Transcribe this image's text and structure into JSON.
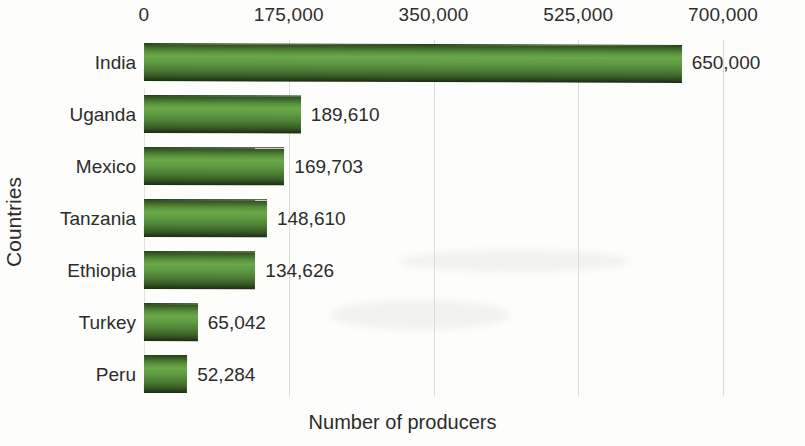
{
  "chart_data": {
    "type": "bar",
    "orientation": "horizontal",
    "title": "",
    "xlabel": "Number of producers",
    "ylabel": "Countries",
    "categories": [
      "India",
      "Uganda",
      "Mexico",
      "Tanzania",
      "Ethiopia",
      "Turkey",
      "Peru"
    ],
    "values": [
      650000,
      189610,
      169703,
      148610,
      134626,
      65042,
      52284
    ],
    "value_labels": [
      "650,000",
      "189,610",
      "169,703",
      "148,610",
      "134,626",
      "65,042",
      "52,284"
    ],
    "xticks": [
      0,
      175000,
      350000,
      525000,
      700000
    ],
    "xtick_labels": [
      "0",
      "175,000",
      "350,000",
      "525,000",
      "700,000"
    ],
    "xlim": [
      0,
      700000
    ],
    "grid": true,
    "grid_axis": "x",
    "legend": null,
    "bar_style": "3d-cylinder",
    "bar_color": "#5e9a41",
    "bar_color_dark": "#24381a",
    "bar_color_light": "#6aa84a",
    "background_color": "#fdfdfb",
    "text_color": "#2c2c2c",
    "gridline_color": "#dcdcd6"
  },
  "axes": {
    "x_title": "Number of producers",
    "y_title": "Countries"
  }
}
